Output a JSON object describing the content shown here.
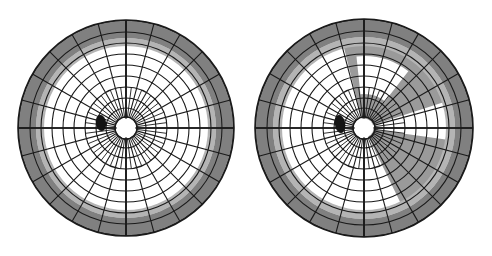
{
  "figure": {
    "background_color": "#ffffff",
    "width": 492,
    "height": 256,
    "panel_count": 2
  },
  "colors": {
    "grid_line": "#1a1a1a",
    "paper_white": "#ffffff",
    "sensitivity_normal": "#ffffff",
    "sensitivity_reduced": "#9a9a9a",
    "sensitivity_depressed": "#808080",
    "peripheral_ring": "#808080",
    "transition_band": "#b4b4b4",
    "blind_spot": "#141414",
    "disc_outline": "#1a1a1a"
  },
  "chart_data": [
    {
      "type": "polar_grid",
      "name": "left-eye-visual-field",
      "title": "",
      "center_x": 126,
      "center_y": 128,
      "radius": 108,
      "grid": true,
      "meridian_count": 24,
      "meridian_step_degrees": 15,
      "inner_meridian_count": 48,
      "ring_count": 10,
      "ring_radii": [
        11,
        20,
        30,
        41,
        52,
        63,
        74,
        85,
        96,
        108
      ],
      "ring_labels": [
        "10",
        "20",
        "30",
        "40",
        "50",
        "60",
        "70",
        "80",
        "90",
        "100"
      ],
      "regions": [
        {
          "label": "central-normal-sensitivity",
          "fill": "#ffffff",
          "inner_radius": 0,
          "outer_radius": 82,
          "start_angle": 0,
          "end_angle": 360
        },
        {
          "label": "peripheral-transition-band",
          "fill": "#b4b4b4",
          "inner_radius": 82,
          "outer_radius": 90,
          "start_angle": 0,
          "end_angle": 360
        },
        {
          "label": "peripheral-depressed-ring",
          "fill": "#808080",
          "inner_radius": 90,
          "outer_radius": 108,
          "start_angle": 0,
          "end_angle": 360
        }
      ],
      "blind_spot": {
        "label": "physiologic-blind-spot",
        "center_x": 101,
        "center_y": 123,
        "radius_x": 5,
        "radius_y": 8,
        "fill": "#141414"
      },
      "annotations": []
    },
    {
      "type": "polar_grid",
      "name": "right-eye-visual-field",
      "title": "",
      "center_x": 364,
      "center_y": 128,
      "radius": 109,
      "grid": true,
      "meridian_count": 24,
      "meridian_step_degrees": 15,
      "inner_meridian_count": 48,
      "ring_count": 10,
      "ring_radii": [
        11,
        20,
        30,
        41,
        52,
        63,
        74,
        85,
        97,
        109
      ],
      "ring_labels": [
        "10",
        "20",
        "30",
        "40",
        "50",
        "60",
        "70",
        "80",
        "90",
        "100"
      ],
      "regions": [
        {
          "label": "central-normal-sensitivity",
          "fill": "#ffffff",
          "inner_radius": 0,
          "outer_radius": 82,
          "start_angle": 0,
          "end_angle": 360
        },
        {
          "label": "superior-nasal-depressed-wedge",
          "fill": "#9a9a9a",
          "inner_radius": 0,
          "outer_radius": 86,
          "start_angle": 18,
          "end_angle": 104
        },
        {
          "label": "temporal-depressed-wedge",
          "fill": "#9a9a9a",
          "inner_radius": 0,
          "outer_radius": 86,
          "start_angle": 296,
          "end_angle": 356
        },
        {
          "label": "spared-superior-island",
          "fill": "#ffffff",
          "inner_radius": 34,
          "outer_radius": 72,
          "start_angle": 52,
          "end_angle": 96
        },
        {
          "label": "spared-temporal-sliver",
          "fill": "#ffffff",
          "inner_radius": 14,
          "outer_radius": 86,
          "start_angle": 352,
          "end_angle": 359
        },
        {
          "label": "peripheral-transition-band",
          "fill": "#b4b4b4",
          "inner_radius": 82,
          "outer_radius": 91,
          "start_angle": 0,
          "end_angle": 360
        },
        {
          "label": "peripheral-depressed-ring",
          "fill": "#808080",
          "inner_radius": 91,
          "outer_radius": 109,
          "start_angle": 0,
          "end_angle": 360
        }
      ],
      "blind_spot": {
        "label": "physiologic-blind-spot",
        "center_x": 340,
        "center_y": 124,
        "radius_x": 5,
        "radius_y": 9,
        "fill": "#141414"
      },
      "annotations": []
    }
  ]
}
